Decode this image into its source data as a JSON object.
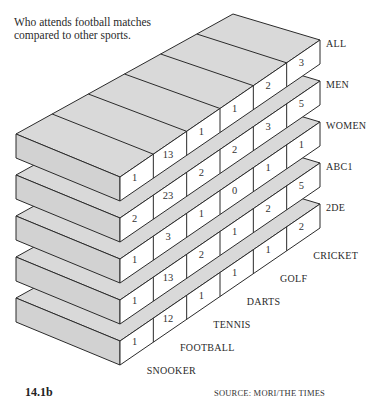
{
  "header": {
    "subtitle": "Who attends football matches compared to other sports."
  },
  "footer": {
    "figure_number": "14.1b",
    "source": "SOURCE: MORI/THE TIMES"
  },
  "chart_data": {
    "type": "table",
    "style": "3d-stacked-slabs",
    "title": "Who attends football matches compared to other sports.",
    "rows": [
      "ALL",
      "MEN",
      "WOMEN",
      "ABC1",
      "2DE"
    ],
    "columns": [
      "SNOOKER",
      "FOOTBALL",
      "TENNIS",
      "DARTS",
      "GOLF",
      "CRICKET"
    ],
    "values": [
      [
        1,
        13,
        1,
        1,
        2,
        3
      ],
      [
        2,
        23,
        2,
        2,
        3,
        5
      ],
      [
        1,
        3,
        1,
        0,
        1,
        1
      ],
      [
        1,
        13,
        2,
        1,
        2,
        5
      ],
      [
        1,
        12,
        1,
        1,
        1,
        2
      ]
    ],
    "series": [
      {
        "name": "ALL",
        "values": [
          1,
          13,
          1,
          1,
          2,
          3
        ]
      },
      {
        "name": "MEN",
        "values": [
          2,
          23,
          2,
          2,
          3,
          5
        ]
      },
      {
        "name": "WOMEN",
        "values": [
          1,
          3,
          1,
          0,
          1,
          1
        ]
      },
      {
        "name": "ABC1",
        "values": [
          1,
          13,
          2,
          1,
          2,
          5
        ]
      },
      {
        "name": "2DE",
        "values": [
          1,
          12,
          1,
          1,
          1,
          2
        ]
      }
    ],
    "source": "SOURCE: MORI/THE TIMES",
    "figure": "14.1b"
  }
}
